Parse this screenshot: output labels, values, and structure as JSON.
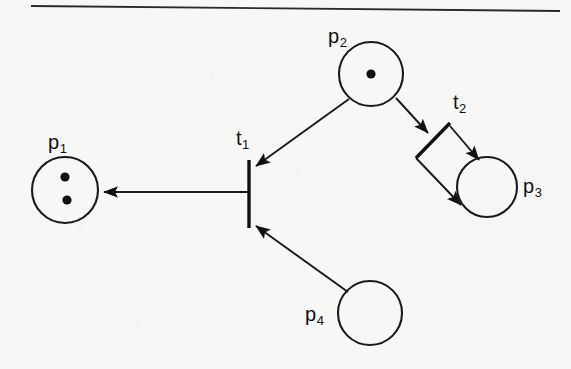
{
  "figure": {
    "type": "petri-net-diagram",
    "top_rule": {
      "visible": true
    },
    "places": [
      {
        "id": "p1",
        "label": "p",
        "subscript": "1",
        "cx": 65,
        "cy": 190,
        "r": 33,
        "tokens": 2,
        "token_positions": [
          [
            65,
            177
          ],
          [
            67,
            200
          ]
        ],
        "label_x": 48,
        "label_y": 132
      },
      {
        "id": "p2",
        "label": "p",
        "subscript": "2",
        "cx": 371,
        "cy": 74,
        "r": 32,
        "tokens": 1,
        "token_positions": [
          [
            371,
            74
          ]
        ],
        "label_x": 328,
        "label_y": 26
      },
      {
        "id": "p3",
        "label": "p",
        "subscript": "3",
        "cx": 487,
        "cy": 187,
        "r": 30,
        "tokens": 0,
        "token_positions": [],
        "label_x": 523,
        "label_y": 176
      },
      {
        "id": "p4",
        "label": "p",
        "subscript": "4",
        "cx": 370,
        "cy": 313,
        "r": 32,
        "tokens": 0,
        "token_positions": [],
        "label_x": 305,
        "label_y": 304
      }
    ],
    "transitions": [
      {
        "id": "t1",
        "label": "t",
        "subscript": "1",
        "orientation": "vertical",
        "x1": 249,
        "y1": 160,
        "x2": 249,
        "y2": 228,
        "label_x": 236,
        "label_y": 128
      },
      {
        "id": "t2",
        "label": "t",
        "subscript": "2",
        "orientation": "diagonal",
        "x1": 450,
        "y1": 123,
        "x2": 416,
        "y2": 158,
        "label_x": 453,
        "label_y": 92
      }
    ],
    "arcs": [
      {
        "id": "arc-p2-t1",
        "from": "p2",
        "to": "t1",
        "x1": 349,
        "y1": 99,
        "x2": 256,
        "y2": 166
      },
      {
        "id": "arc-t1-p1",
        "from": "t1",
        "to": "p1",
        "x1": 248,
        "y1": 192,
        "x2": 101,
        "y2": 192
      },
      {
        "id": "arc-p4-t1",
        "from": "p4",
        "to": "t1",
        "x1": 348,
        "y1": 292,
        "x2": 255,
        "y2": 225
      },
      {
        "id": "arc-p2-t2",
        "from": "p2",
        "to": "t2",
        "x1": 396,
        "y1": 98,
        "x2": 428,
        "y2": 133
      },
      {
        "id": "arc-t2-p3-upper",
        "from": "t2",
        "to": "p3",
        "x1": 450,
        "y1": 126,
        "x2": 478,
        "y2": 159
      },
      {
        "id": "arc-t2-p3-lower",
        "from": "t2",
        "to": "p3",
        "x1": 416,
        "y1": 158,
        "x2": 459,
        "y2": 203
      }
    ],
    "colors": {
      "ink": "#111111",
      "stroke": "#1a1a1a",
      "paper": "#f7f7f5"
    }
  }
}
